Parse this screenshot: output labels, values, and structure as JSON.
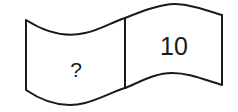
{
  "diagram": {
    "type": "wavy-banner",
    "stroke_color": "#1a1a1a",
    "fill_color": "#ffffff",
    "cells": [
      {
        "label": "?"
      },
      {
        "label": "10"
      }
    ]
  }
}
